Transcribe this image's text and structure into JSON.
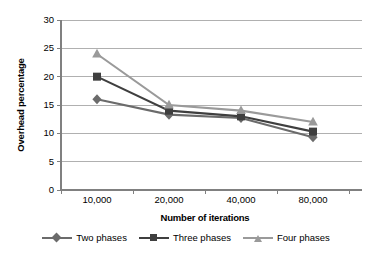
{
  "chart_data": {
    "type": "line",
    "title": "",
    "xlabel": "Number of iterations",
    "ylabel": "Overhead percentage",
    "categories": [
      "10,000",
      "20,000",
      "40,000",
      "80,000"
    ],
    "x_values": [
      10000,
      20000,
      40000,
      80000
    ],
    "ylim": [
      0,
      30
    ],
    "yticks": [
      0,
      5,
      10,
      15,
      20,
      25,
      30
    ],
    "ytick_labels": [
      "0",
      "5",
      "10",
      "15",
      "20",
      "25",
      "30"
    ],
    "grid": "horizontal",
    "legend_position": "bottom",
    "series": [
      {
        "name": "Two phases",
        "marker": "diamond",
        "color": "#6b6b6b",
        "values": [
          16,
          13.3,
          12.7,
          9.3
        ]
      },
      {
        "name": "Three phases",
        "marker": "square",
        "color": "#3f3f3f",
        "values": [
          20,
          14,
          13,
          10.3
        ]
      },
      {
        "name": "Four phases",
        "marker": "triangle",
        "color": "#9a9a9a",
        "values": [
          24,
          15,
          14,
          12
        ]
      }
    ]
  },
  "axes": {
    "y_title": "Overhead percentage",
    "x_title": "Number of iterations"
  },
  "legend": {
    "items": [
      {
        "label": "Two phases"
      },
      {
        "label": "Three phases"
      },
      {
        "label": "Four phases"
      }
    ]
  },
  "colors": {
    "two_phases": "#6b6b6b",
    "three_phases": "#3f3f3f",
    "four_phases": "#9a9a9a",
    "grid": "#b0b0b0",
    "axis": "#808080",
    "background": "#ffffff"
  }
}
